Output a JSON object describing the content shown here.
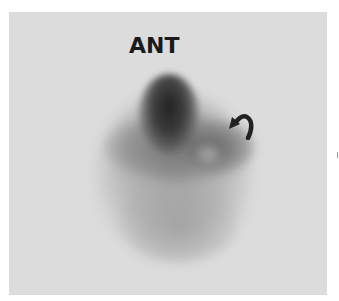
{
  "image": {
    "type": "nuclear-medicine-scan",
    "view_label": "ANT",
    "annotations": [
      {
        "kind": "curved-arrow",
        "icon": "curved-arrow-icon",
        "points_to": "focal uptake on right side of organ"
      }
    ],
    "colors": {
      "background": "#ffffff",
      "scan_field": "#dcdcdc",
      "label": "#1a1a1a",
      "arrow": "#222222"
    }
  }
}
